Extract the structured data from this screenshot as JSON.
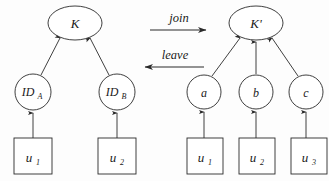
{
  "figure": {
    "type": "diagram",
    "background_color": "#fdfdfd",
    "stroke_color": "#2a2a2a"
  },
  "operations": [
    {
      "id": "join",
      "label": "join",
      "direction": "right",
      "x": 150,
      "y": 25,
      "length": 58
    },
    {
      "id": "leave",
      "label": "leave",
      "direction": "left",
      "x": 142,
      "y": 63,
      "length": 62
    }
  ],
  "left_tree": {
    "name": "before",
    "root": {
      "id": "K",
      "label": "K",
      "subscript": "",
      "shape": "ellipse",
      "cx": 75,
      "cy": 23,
      "rx": 27,
      "ry": 17
    },
    "mid_nodes": [
      {
        "id": "ID_A",
        "label": "ID",
        "subscript": "A",
        "shape": "circle",
        "cx": 33,
        "cy": 92,
        "r": 18
      },
      {
        "id": "ID_B",
        "label": "ID",
        "subscript": "B",
        "shape": "circle",
        "cx": 117,
        "cy": 92,
        "r": 18
      }
    ],
    "leaf_nodes": [
      {
        "id": "u1L",
        "label": "u",
        "subscript": "1",
        "shape": "rect",
        "x": 14,
        "y": 138,
        "w": 38,
        "h": 36
      },
      {
        "id": "u2L",
        "label": "u",
        "subscript": "2",
        "shape": "rect",
        "x": 98,
        "y": 138,
        "w": 38,
        "h": 36
      }
    ]
  },
  "right_tree": {
    "name": "after",
    "root": {
      "id": "Kprime",
      "label": "K'",
      "subscript": "",
      "shape": "ellipse",
      "cx": 256,
      "cy": 23,
      "rx": 27,
      "ry": 17
    },
    "mid_nodes": [
      {
        "id": "a",
        "label": "a",
        "subscript": "",
        "shape": "circle",
        "cx": 204,
        "cy": 92,
        "r": 17
      },
      {
        "id": "b",
        "label": "b",
        "subscript": "",
        "shape": "circle",
        "cx": 256,
        "cy": 92,
        "r": 17
      },
      {
        "id": "c",
        "label": "c",
        "subscript": "",
        "shape": "circle",
        "cx": 306,
        "cy": 92,
        "r": 17
      }
    ],
    "leaf_nodes": [
      {
        "id": "u1R",
        "label": "u",
        "subscript": "1",
        "shape": "rect",
        "x": 187,
        "y": 138,
        "w": 36,
        "h": 36
      },
      {
        "id": "u2R",
        "label": "u",
        "subscript": "2",
        "shape": "rect",
        "x": 239,
        "y": 138,
        "w": 36,
        "h": 36
      },
      {
        "id": "u3R",
        "label": "u",
        "subscript": "3",
        "shape": "rect",
        "x": 291,
        "y": 138,
        "w": 36,
        "h": 36
      }
    ]
  }
}
